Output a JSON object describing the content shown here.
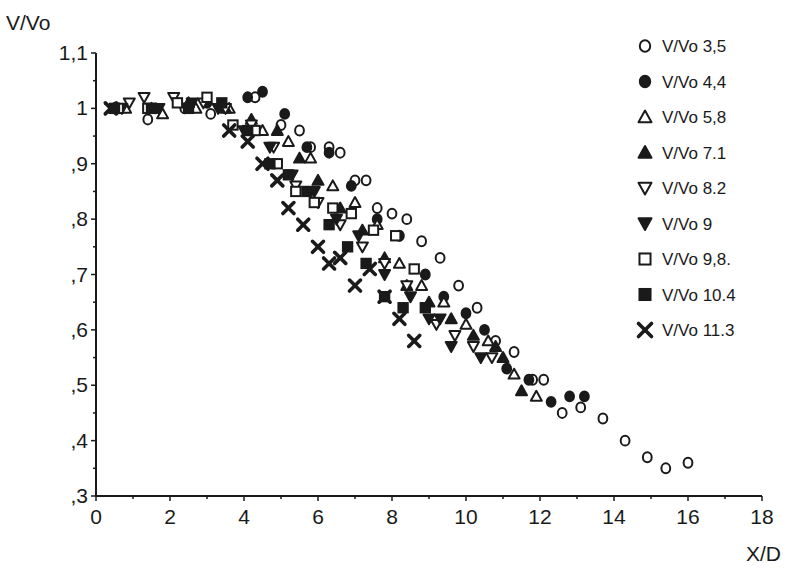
{
  "chart_data": {
    "type": "scatter",
    "title": "",
    "xlabel": "X/D",
    "ylabel": "V/Vo",
    "xlim": [
      0,
      18
    ],
    "ylim": [
      0.3,
      1.1
    ],
    "x_ticks": [
      0,
      2,
      4,
      6,
      8,
      10,
      12,
      14,
      16,
      18
    ],
    "x_tick_labels": [
      "0",
      "2",
      "4",
      "6",
      "8",
      "10",
      "12",
      "14",
      "16",
      "18"
    ],
    "y_ticks": [
      0.3,
      0.4,
      0.5,
      0.6,
      0.7,
      0.8,
      0.9,
      1.0,
      1.1
    ],
    "y_tick_labels": [
      ",3",
      ",4",
      ",5",
      ",6",
      ",7",
      ",8",
      ",9",
      "1",
      "1,1"
    ],
    "grid": false,
    "legend_position": "upper right",
    "series": [
      {
        "name": "V/Vo 3,5",
        "marker": "circle-open",
        "x": [
          0.5,
          1.4,
          2.4,
          3.1,
          4.3,
          5.0,
          5.5,
          5.8,
          6.3,
          6.6,
          7.0,
          7.3,
          7.6,
          8.0,
          8.4,
          8.8,
          9.3,
          9.8,
          10.3,
          10.8,
          11.3,
          11.8,
          12.1,
          12.6,
          13.1,
          13.7,
          14.3,
          14.9,
          15.4,
          16.0
        ],
        "y": [
          1.0,
          0.98,
          1.0,
          0.99,
          1.02,
          0.97,
          0.96,
          0.93,
          0.93,
          0.92,
          0.87,
          0.87,
          0.82,
          0.81,
          0.8,
          0.76,
          0.73,
          0.68,
          0.64,
          0.58,
          0.56,
          0.51,
          0.51,
          0.45,
          0.46,
          0.44,
          0.4,
          0.37,
          0.35,
          0.36
        ]
      },
      {
        "name": "V/Vo 4,4",
        "marker": "circle-filled",
        "x": [
          0.6,
          1.6,
          3.0,
          4.1,
          4.5,
          5.1,
          5.7,
          6.3,
          6.9,
          7.6,
          8.2,
          8.9,
          9.4,
          10.0,
          10.5,
          11.1,
          11.7,
          12.3,
          12.8,
          13.2
        ],
        "y": [
          1.0,
          1.0,
          1.01,
          1.02,
          1.03,
          0.99,
          0.93,
          0.92,
          0.86,
          0.8,
          0.77,
          0.7,
          0.66,
          0.63,
          0.6,
          0.53,
          0.51,
          0.47,
          0.48,
          0.48
        ]
      },
      {
        "name": "V/Vo 5,8",
        "marker": "triangle-up-open",
        "x": [
          0.8,
          1.8,
          2.7,
          3.6,
          4.5,
          5.2,
          5.8,
          6.4,
          7.0,
          7.6,
          8.2,
          8.8,
          9.4,
          10.0,
          10.6,
          11.3,
          11.9
        ],
        "y": [
          1.0,
          0.99,
          1.0,
          1.0,
          0.96,
          0.94,
          0.91,
          0.86,
          0.83,
          0.79,
          0.72,
          0.68,
          0.65,
          0.61,
          0.58,
          0.52,
          0.48
        ]
      },
      {
        "name": "V/Vo 7.1",
        "marker": "triangle-up-filled",
        "x": [
          0.5,
          1.5,
          2.5,
          3.5,
          4.2,
          4.9,
          5.5,
          6.0,
          6.6,
          7.2,
          7.8,
          8.4,
          9.0,
          9.6,
          10.2,
          10.8,
          11.0,
          11.5
        ],
        "y": [
          1.0,
          1.0,
          1.01,
          1.0,
          0.98,
          0.96,
          0.91,
          0.87,
          0.82,
          0.78,
          0.73,
          0.68,
          0.65,
          0.62,
          0.59,
          0.57,
          0.55,
          0.49
        ]
      },
      {
        "name": "V/Vo 8.2",
        "marker": "triangle-down-open",
        "x": [
          0.9,
          1.3,
          2.1,
          2.9,
          3.5,
          4.2,
          4.8,
          5.4,
          6.0,
          6.6,
          7.2,
          7.8,
          8.4,
          9.2,
          9.7,
          10.2,
          10.7
        ],
        "y": [
          1.01,
          1.02,
          1.02,
          1.01,
          1.0,
          0.97,
          0.93,
          0.86,
          0.83,
          0.79,
          0.75,
          0.72,
          0.68,
          0.61,
          0.59,
          0.57,
          0.55
        ]
      },
      {
        "name": "V/Vo 9",
        "marker": "triangle-down-filled",
        "x": [
          0.7,
          1.7,
          2.6,
          3.3,
          4.0,
          4.7,
          5.3,
          5.9,
          6.5,
          7.1,
          7.8,
          8.5,
          9.0,
          9.3,
          9.6,
          10.4
        ],
        "y": [
          1.0,
          1.0,
          1.01,
          1.0,
          0.96,
          0.93,
          0.88,
          0.85,
          0.8,
          0.77,
          0.7,
          0.66,
          0.62,
          0.62,
          0.57,
          0.55
        ]
      },
      {
        "name": "V/Vo 9,8.",
        "marker": "square-open",
        "x": [
          0.6,
          1.4,
          2.2,
          3.0,
          3.7,
          4.3,
          4.9,
          5.4,
          5.9,
          6.4,
          6.9,
          7.5,
          8.1,
          8.6
        ],
        "y": [
          1.0,
          1.0,
          1.01,
          1.02,
          0.97,
          0.96,
          0.9,
          0.85,
          0.83,
          0.82,
          0.81,
          0.78,
          0.77,
          0.71
        ]
      },
      {
        "name": "V/Vo 10.4",
        "marker": "square-filled",
        "x": [
          0.5,
          1.5,
          2.5,
          3.4,
          4.1,
          4.7,
          5.2,
          5.7,
          6.3,
          6.8,
          7.3,
          7.8,
          8.3,
          8.9
        ],
        "y": [
          1.0,
          1.0,
          1.0,
          1.01,
          0.96,
          0.9,
          0.88,
          0.85,
          0.79,
          0.75,
          0.72,
          0.66,
          0.64,
          0.64
        ]
      },
      {
        "name": "V/Vo 11.3",
        "marker": "x-cross",
        "x": [
          0.4,
          3.6,
          4.1,
          4.5,
          4.9,
          5.2,
          5.6,
          6.0,
          6.3,
          6.6,
          7.0,
          7.4,
          7.8,
          8.2,
          8.6
        ],
        "y": [
          1.0,
          0.96,
          0.94,
          0.9,
          0.87,
          0.82,
          0.79,
          0.75,
          0.72,
          0.73,
          0.68,
          0.71,
          0.66,
          0.62,
          0.58
        ]
      }
    ]
  }
}
